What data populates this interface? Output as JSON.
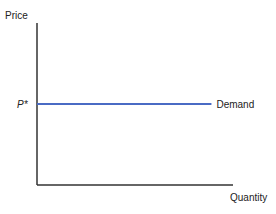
{
  "chart_data": {
    "type": "line",
    "title": "",
    "xlabel": "Quantity",
    "ylabel": "Price",
    "xlim": [
      0,
      1
    ],
    "ylim": [
      0,
      1
    ],
    "grid": false,
    "series": [
      {
        "name": "Demand",
        "x": [
          0,
          0.89
        ],
        "y": [
          0.5,
          0.5
        ],
        "color": "#4a6bc4"
      }
    ],
    "annotations": [
      {
        "text": "P*",
        "y": 0.5,
        "axis": "y"
      }
    ],
    "axis_color": "#333333"
  }
}
